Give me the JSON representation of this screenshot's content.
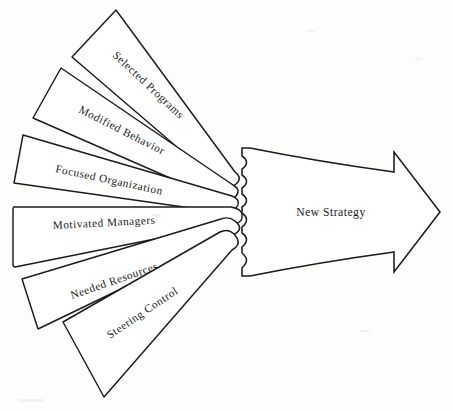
{
  "diagram": {
    "type": "converging-arrow-fan",
    "background_color": "#fdfdfb",
    "ink_color": "#1b1b1b",
    "convergence_point": {
      "x": 243,
      "y": 212
    },
    "inputs": [
      {
        "id": "selected-programs",
        "label": "Selected Programs",
        "index": 1,
        "angle_deg": -46,
        "text_rotation_deg": 43,
        "text_anchor": {
          "x": 108,
          "y": 50
        }
      },
      {
        "id": "modified-behavior",
        "label": "Modified Behavior",
        "index": 2,
        "angle_deg": -29,
        "text_rotation_deg": 27,
        "text_anchor": {
          "x": 76,
          "y": 108
        }
      },
      {
        "id": "focused-organization",
        "label": "Focused Organization",
        "index": 3,
        "angle_deg": -13,
        "text_rotation_deg": 12,
        "text_anchor": {
          "x": 56,
          "y": 169
        }
      },
      {
        "id": "motivated-managers",
        "label": "Motivated Managers",
        "index": 4,
        "angle_deg": 2,
        "text_rotation_deg": -3,
        "text_anchor": {
          "x": 52,
          "y": 228
        }
      },
      {
        "id": "needed-resources",
        "label": "Needed Resources",
        "index": 5,
        "angle_deg": 18,
        "text_rotation_deg": -19,
        "text_anchor": {
          "x": 70,
          "y": 295
        }
      },
      {
        "id": "steering-control",
        "label": "Steering Control",
        "index": 6,
        "angle_deg": 34,
        "text_rotation_deg": -34,
        "text_anchor": {
          "x": 106,
          "y": 335
        }
      }
    ],
    "output": {
      "id": "new-strategy",
      "label": "New Strategy",
      "label_position": {
        "x": 331,
        "y": 216
      },
      "direction": "right",
      "tip": {
        "x": 440,
        "y": 212
      }
    }
  }
}
